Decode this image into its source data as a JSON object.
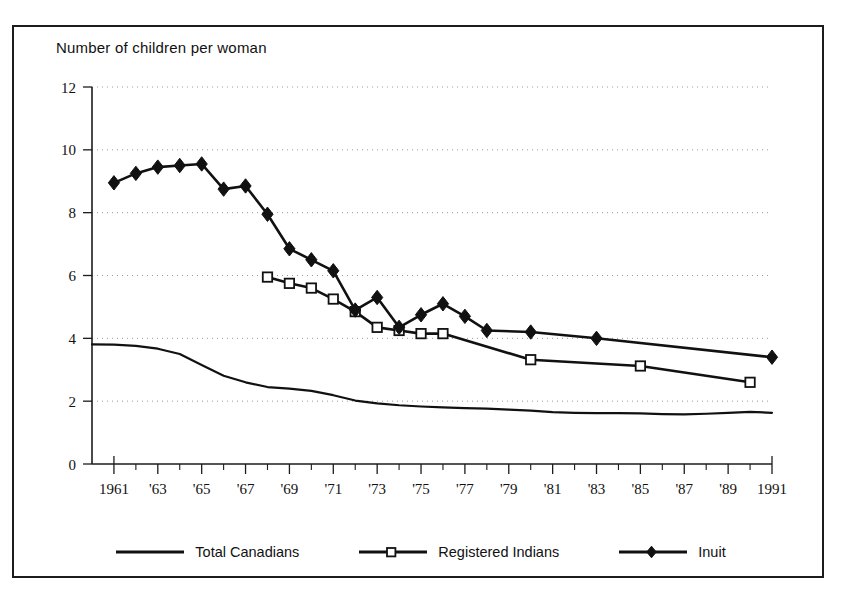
{
  "chart_data": {
    "type": "line",
    "title": "Number of children per woman",
    "xlabel": "",
    "ylabel": "Number of children per woman",
    "xlim": [
      1960,
      1991
    ],
    "ylim": [
      0,
      12
    ],
    "yticks": [
      0,
      2,
      4,
      6,
      8,
      10,
      12
    ],
    "ytick_labels": [
      "0",
      "2",
      "4",
      "6",
      "8",
      "10",
      "12"
    ],
    "xticks": [
      1961,
      1963,
      1965,
      1967,
      1969,
      1971,
      1973,
      1975,
      1977,
      1979,
      1981,
      1983,
      1985,
      1987,
      1989,
      1991
    ],
    "xtick_labels": [
      "1961",
      "'63",
      "'65",
      "'67",
      "'69",
      "'71",
      "'73",
      "'75",
      "'77",
      "'79",
      "'81",
      "'83",
      "'85",
      "'87",
      "'89",
      "1991"
    ],
    "grid": "horizontal-dotted",
    "legend_position": "bottom",
    "series": [
      {
        "name": "Total Canadians",
        "marker": "none",
        "x": [
          1960,
          1961,
          1962,
          1963,
          1964,
          1965,
          1966,
          1967,
          1968,
          1969,
          1970,
          1971,
          1972,
          1973,
          1974,
          1975,
          1976,
          1977,
          1978,
          1979,
          1980,
          1981,
          1982,
          1983,
          1984,
          1985,
          1986,
          1987,
          1988,
          1989,
          1990,
          1991
        ],
        "values": [
          3.81,
          3.8,
          3.76,
          3.67,
          3.5,
          3.15,
          2.81,
          2.6,
          2.45,
          2.4,
          2.33,
          2.19,
          2.02,
          1.93,
          1.87,
          1.83,
          1.8,
          1.78,
          1.76,
          1.73,
          1.7,
          1.65,
          1.63,
          1.62,
          1.62,
          1.61,
          1.59,
          1.58,
          1.6,
          1.63,
          1.66,
          1.63
        ]
      },
      {
        "name": "Registered Indians",
        "marker": "open-square",
        "x": [
          1968,
          1969,
          1970,
          1971,
          1972,
          1973,
          1974,
          1975,
          1976,
          1980,
          1985,
          1990
        ],
        "values": [
          5.95,
          5.75,
          5.6,
          5.25,
          4.85,
          4.35,
          4.25,
          4.15,
          4.15,
          3.32,
          3.12,
          2.6
        ]
      },
      {
        "name": "Inuit",
        "marker": "filled-diamond",
        "x": [
          1961,
          1962,
          1963,
          1964,
          1965,
          1966,
          1967,
          1968,
          1969,
          1970,
          1971,
          1972,
          1973,
          1974,
          1975,
          1976,
          1977,
          1978,
          1980,
          1983,
          1991
        ],
        "values": [
          8.95,
          9.25,
          9.45,
          9.5,
          9.55,
          8.75,
          8.85,
          7.95,
          6.85,
          6.5,
          6.15,
          4.9,
          5.3,
          4.35,
          4.75,
          5.1,
          4.7,
          4.25,
          4.2,
          4.0,
          3.4
        ]
      }
    ]
  },
  "legend": {
    "items": [
      {
        "label": "Total Canadians",
        "marker": "none"
      },
      {
        "label": "Registered Indians",
        "marker": "open-square"
      },
      {
        "label": "Inuit",
        "marker": "filled-diamond"
      }
    ]
  }
}
